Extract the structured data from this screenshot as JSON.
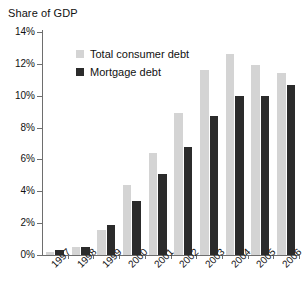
{
  "chart_data": {
    "type": "bar",
    "title": "Share of GDP",
    "xlabel": "",
    "ylabel": "Share of GDP",
    "ylim": [
      0,
      14
    ],
    "ytick_labels": [
      "0%",
      "2%",
      "4%",
      "6%",
      "8%",
      "10%",
      "12%",
      "14%"
    ],
    "ytick_values": [
      0,
      2,
      4,
      6,
      8,
      10,
      12,
      14
    ],
    "grid": false,
    "legend_position": "top-left-inside",
    "categories": [
      "1997",
      "1998",
      "1999",
      "2000",
      "2001",
      "2002",
      "2003",
      "2004",
      "2005",
      "2006"
    ],
    "series": [
      {
        "name": "Total consumer debt",
        "color": "#d4d4d4",
        "values": [
          0.2,
          0.5,
          1.6,
          4.4,
          6.4,
          8.9,
          11.6,
          12.6,
          11.9,
          11.4
        ]
      },
      {
        "name": "Mortgage debt",
        "color": "#2b2b2b",
        "values": [
          0.3,
          0.5,
          1.9,
          3.4,
          5.1,
          6.8,
          8.7,
          10.0,
          10.0,
          10.7
        ]
      }
    ]
  },
  "axis": {
    "y_min_label": "0%",
    "y_max_label": "14%"
  },
  "legend": {
    "items": [
      {
        "label": "Total consumer debt",
        "swatch": "total"
      },
      {
        "label": "Mortgage debt",
        "swatch": "mortgage"
      }
    ]
  }
}
